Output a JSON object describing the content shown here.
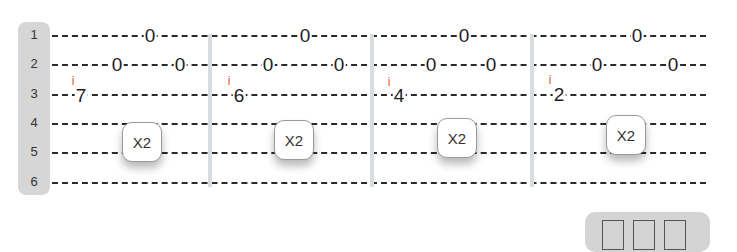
{
  "strings": {
    "labels": [
      "1",
      "2",
      "3",
      "4",
      "5",
      "6"
    ]
  },
  "measures": [
    {
      "finger_marker": "i",
      "notes": [
        {
          "string": 3,
          "fret": "7"
        },
        {
          "string": 2,
          "fret": "0"
        },
        {
          "string": 1,
          "fret": "0"
        },
        {
          "string": 2,
          "fret": "0"
        }
      ],
      "repeat_label": "X2"
    },
    {
      "finger_marker": "i",
      "notes": [
        {
          "string": 3,
          "fret": "6"
        },
        {
          "string": 2,
          "fret": "0"
        },
        {
          "string": 1,
          "fret": "0"
        },
        {
          "string": 2,
          "fret": "0"
        }
      ],
      "repeat_label": "X2"
    },
    {
      "finger_marker": "i",
      "notes": [
        {
          "string": 3,
          "fret": "4"
        },
        {
          "string": 2,
          "fret": "0"
        },
        {
          "string": 1,
          "fret": "0"
        },
        {
          "string": 2,
          "fret": "0"
        }
      ],
      "repeat_label": "X2"
    },
    {
      "finger_marker": "i",
      "notes": [
        {
          "string": 3,
          "fret": "2"
        },
        {
          "string": 2,
          "fret": "0"
        },
        {
          "string": 1,
          "fret": "0"
        },
        {
          "string": 2,
          "fret": "0"
        }
      ],
      "repeat_label": "X2"
    }
  ],
  "layout_widget": {
    "icon": "three-column-layout-icon"
  },
  "colors": {
    "finger_marker": "#e0542e",
    "label_bar": "#d6d6d6",
    "bar_line": "#d9dde0"
  }
}
